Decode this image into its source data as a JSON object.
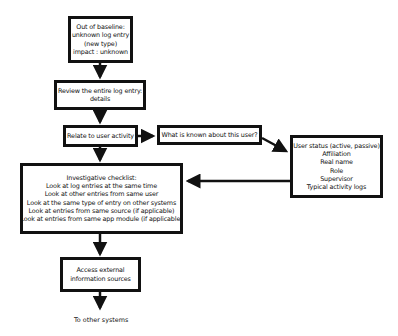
{
  "diagram": {
    "nodes": {
      "out_of_baseline": {
        "lines": [
          "Out of baseline:",
          "unknown log entry",
          "(new type)",
          "impact : unknown"
        ]
      },
      "review": {
        "lines": [
          "Review the entire log entry:",
          "details"
        ]
      },
      "relate": {
        "lines": [
          "Relate to user activity"
        ]
      },
      "known": {
        "lines": [
          "What is known about this user?"
        ]
      },
      "user_status": {
        "lines": [
          "User status (active, passive)",
          "Affiliation",
          "Real name",
          "Role",
          "Supervisor",
          "Typical activity logs"
        ]
      },
      "checklist": {
        "lines": [
          "Investigative checklist:",
          "Look at log entries at the same time",
          "Look at other entries from same user",
          "Look at the same type of entry on other systems",
          "Look at entries from same source (if applicable)",
          "Look at entries from same app module (if applicable)"
        ]
      },
      "external": {
        "lines": [
          "Access external",
          "information sources"
        ]
      }
    },
    "end_label": "To other systems",
    "edges": [
      [
        "out_of_baseline",
        "review"
      ],
      [
        "review",
        "relate"
      ],
      [
        "relate",
        "known"
      ],
      [
        "known",
        "user_status"
      ],
      [
        "user_status",
        "checklist"
      ],
      [
        "relate",
        "checklist"
      ],
      [
        "checklist",
        "external"
      ],
      [
        "external",
        "To other systems"
      ]
    ],
    "colors": {
      "stroke": "#111111",
      "background": "#ffffff"
    }
  }
}
